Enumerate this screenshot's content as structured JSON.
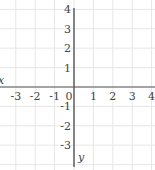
{
  "diagram": {
    "type": "coordinate-plane",
    "origin_px": [
      74,
      87
    ],
    "unit_px": 19.4,
    "x_axis": {
      "label": "x",
      "ticks": [
        -3,
        -2,
        -1,
        0,
        1,
        2,
        3,
        4
      ]
    },
    "y_axis": {
      "label": "y",
      "ticks": [
        4,
        3,
        2,
        1,
        -1,
        -2,
        -3
      ]
    },
    "grid": {
      "x_lines": [
        -3.5,
        -3,
        -2,
        -1,
        0,
        1,
        2,
        3,
        4
      ],
      "y_lines": [
        4,
        3,
        2,
        1,
        0,
        -1,
        -2,
        -3,
        -4
      ],
      "color": "#e6e6e6"
    },
    "colors": {
      "axis": "#555555",
      "text": "#444444",
      "background": "#ffffff"
    }
  }
}
